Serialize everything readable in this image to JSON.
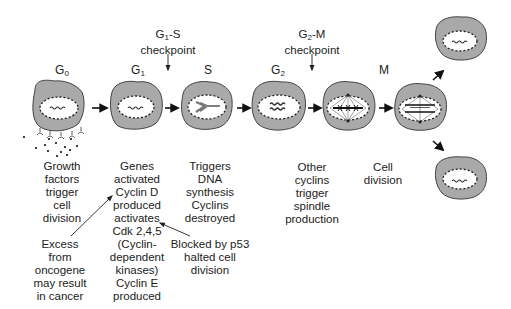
{
  "diagram": {
    "colors": {
      "cytoplasm": "#a9a9a9",
      "cell_outline": "#4a4a4a",
      "nucleus": "#ffffff",
      "text": "#222222"
    },
    "phases": [
      {
        "id": "g0",
        "base": "G",
        "sub": "0"
      },
      {
        "id": "g1",
        "base": "G",
        "sub": "1"
      },
      {
        "id": "s",
        "base": "S",
        "sub": ""
      },
      {
        "id": "g2",
        "base": "G",
        "sub": "2"
      },
      {
        "id": "m",
        "base": "M",
        "sub": ""
      }
    ],
    "checkpoints": [
      {
        "id": "g1s",
        "line1_base": "G",
        "line1_sub": "1",
        "line1_rest": "-S",
        "line2": "checkpoint"
      },
      {
        "id": "g2m",
        "line1_base": "G",
        "line1_sub": "2",
        "line1_rest": "-M",
        "line2": "checkpoint"
      }
    ],
    "descriptions": {
      "g0": [
        "Growth",
        "factors",
        "trigger",
        "cell",
        "division"
      ],
      "g1": [
        "Genes",
        "activated",
        "Cyclin D",
        "produced",
        "activates",
        "Cdk 2,4,5",
        "(Cyclin-",
        "dependent",
        "kinases)",
        "Cyclin E",
        "produced"
      ],
      "s": [
        "Triggers",
        "DNA",
        "synthesis",
        "Cyclins",
        "destroyed"
      ],
      "g2": [
        "Other",
        "cyclins",
        "trigger",
        "spindle",
        "production"
      ],
      "m": [
        "Cell",
        "division"
      ]
    },
    "annotations": {
      "oncogene": [
        "Excess",
        "from",
        "oncogene",
        "may result",
        "in cancer"
      ],
      "p53": [
        "Blocked by p53",
        "halted cell",
        "division"
      ]
    }
  }
}
